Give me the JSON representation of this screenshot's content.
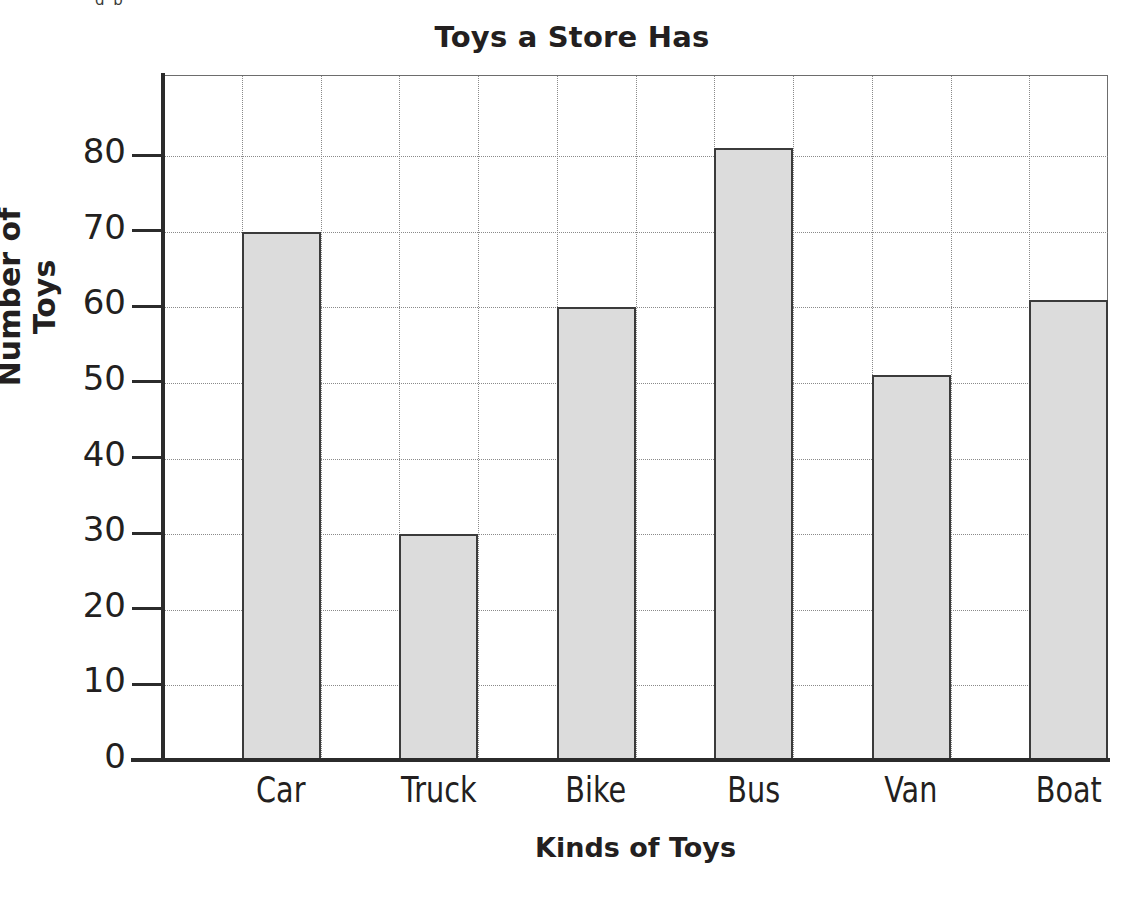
{
  "chart_data": {
    "type": "bar",
    "title": "Toys a Store Has",
    "xlabel": "Kinds of Toys",
    "ylabel": "Number of Toys",
    "categories": [
      "Car",
      "Truck",
      "Bike",
      "Bus",
      "Van",
      "Boat"
    ],
    "values": [
      70,
      30,
      60,
      81,
      51,
      61
    ],
    "ylim": [
      0,
      90
    ],
    "ytick_labels": [
      "0",
      "10",
      "20",
      "30",
      "40",
      "50",
      "60",
      "70",
      "80"
    ],
    "ytick_values": [
      0,
      10,
      20,
      30,
      40,
      50,
      60,
      70,
      80
    ],
    "grid": true,
    "legend": "none",
    "bar_fill_color": "#dcdcdc",
    "bar_edge_color": "#3b3b3b",
    "axis_color": "#2b2b2b",
    "grid_color": "#8a8a8a",
    "text_color": "#231f20",
    "background_color": "#ffffff"
  },
  "artifact": {
    "top_sliver_text": "g  p"
  }
}
